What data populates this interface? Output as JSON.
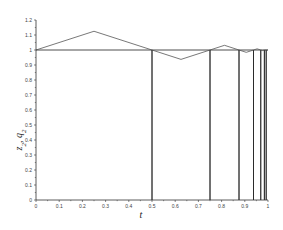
{
  "chart_data": {
    "type": "line",
    "title": "",
    "xlabel": "t",
    "ylabel": "z2, q2",
    "xlim": [
      0,
      1
    ],
    "ylim": [
      0,
      1.2
    ],
    "grid": false,
    "legend": null,
    "xticks": [
      "0",
      "0.1",
      "0.2",
      "0.3",
      "0.4",
      "0.5",
      "0.6",
      "0.7",
      "0.8",
      "0.9",
      "1"
    ],
    "yticks": [
      "0",
      "0.1",
      "0.2",
      "0.3",
      "0.4",
      "0.5",
      "0.6",
      "0.7",
      "0.8",
      "0.9",
      "1",
      "1.1",
      "1.2"
    ],
    "series": [
      {
        "name": "z2 (step / reset function)",
        "color": "#222222",
        "x": [
          0,
          0.5,
          0.5,
          0.5,
          0.75,
          0.75,
          0.75,
          0.875,
          0.875,
          0.875,
          0.9375,
          0.9375,
          0.9375,
          0.96875,
          0.96875,
          0.96875,
          0.984375,
          0.984375,
          0.984375,
          0.9921875,
          0.9921875,
          0.9921875,
          1
        ],
        "y": [
          1,
          1,
          0,
          1,
          1,
          0,
          1,
          1,
          0,
          1,
          1,
          0,
          1,
          1,
          0,
          1,
          1,
          0,
          1,
          1,
          0,
          1,
          1
        ]
      },
      {
        "name": "q2 (zigzag)",
        "color": "#555555",
        "x": [
          0,
          0.25,
          0.5,
          0.625,
          0.75,
          0.8125,
          0.875,
          0.90625,
          0.9375,
          0.953125,
          0.96875,
          0.9765625,
          0.984375,
          1
        ],
        "y": [
          1,
          1.125,
          1,
          0.9375,
          1,
          1.03125,
          1,
          0.984375,
          1,
          1.0078125,
          1,
          0.99609375,
          1,
          1
        ]
      }
    ]
  },
  "labels": {
    "xlabel": "t",
    "ylabel_main": "z",
    "ylabel_sub1": "2",
    "ylabel_sep": ", ",
    "ylabel_main2": "q",
    "ylabel_sub2": "2"
  }
}
